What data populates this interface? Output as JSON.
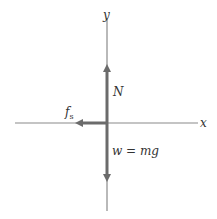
{
  "diagram": {
    "type": "free-body diagram",
    "axes": {
      "x_label": "x",
      "y_label": "y"
    },
    "forces": [
      {
        "name": "normal-force",
        "label": "N",
        "direction": "up"
      },
      {
        "name": "weight",
        "label": "w = mg",
        "direction": "down"
      },
      {
        "name": "static-friction",
        "label_main": "f",
        "label_sub": "s",
        "direction": "left"
      }
    ],
    "colors": {
      "axis": "#8a8a8a",
      "force": "#6b6b6b",
      "text": "#333333"
    }
  }
}
